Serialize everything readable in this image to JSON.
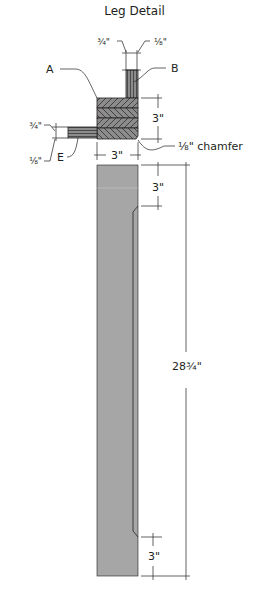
{
  "title": "Leg Detail",
  "labels": {
    "A": "A",
    "B": "B",
    "E": "E"
  },
  "dimensions": {
    "top_left_thickness": "¾\"",
    "top_right_gap": "⅛\"",
    "block_height": "3\"",
    "block_width": "3\"",
    "chamfer": "⅛\" chamfer",
    "side_thickness": "¾\"",
    "side_offset": "⅛\"",
    "leg_top_taper": "3\"",
    "leg_total": "28¾\"",
    "leg_bottom_taper": "3\""
  },
  "colors": {
    "line": "#231f20",
    "leg_fill": "#a6a6a6",
    "hatch_fill": "#8c8c8c",
    "hatch_line": "#3a3a3a"
  }
}
